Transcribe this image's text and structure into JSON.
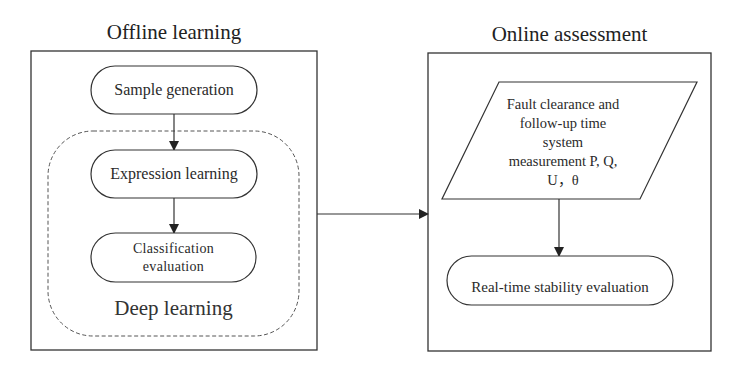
{
  "diagram": {
    "panels": [
      {
        "id": "offline",
        "title": "Offline learning",
        "nodes": [
          {
            "id": "sample-generation",
            "shape": "rounded-pill",
            "label": "Sample generation"
          },
          {
            "id": "expression-learning",
            "shape": "rounded-pill",
            "label": "Expression learning"
          },
          {
            "id": "classification-evaluation",
            "shape": "rounded-pill",
            "label": "Classification evaluation",
            "lines": [
              "Classification",
              "evaluation"
            ]
          }
        ],
        "group": {
          "id": "deep-learning",
          "style": "dashed-rounded",
          "label": "Deep learning",
          "contains": [
            "expression-learning",
            "classification-evaluation"
          ]
        }
      },
      {
        "id": "online",
        "title": "Online assessment",
        "nodes": [
          {
            "id": "measurement",
            "shape": "parallelogram",
            "label": "Fault clearance and follow-up time system measurement P, Q, U, θ",
            "lines": [
              "Fault clearance and",
              "follow-up time",
              "system",
              "measurement P, Q,",
              "U，θ"
            ]
          },
          {
            "id": "real-time-stability",
            "shape": "rounded-pill",
            "label": "Real-time stability evaluation"
          }
        ]
      }
    ],
    "edges": [
      {
        "from": "sample-generation",
        "to": "expression-learning"
      },
      {
        "from": "expression-learning",
        "to": "classification-evaluation"
      },
      {
        "from": "offline",
        "to": "online"
      },
      {
        "from": "measurement",
        "to": "real-time-stability"
      }
    ],
    "colors": {
      "stroke": "#2a2a2a",
      "background": "#ffffff",
      "text": "#2a2a2a"
    }
  }
}
